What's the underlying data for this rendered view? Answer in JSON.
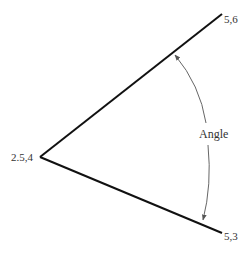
{
  "diagram": {
    "type": "angle-diagram",
    "vertex": {
      "label": "2.5,4"
    },
    "upper_point": {
      "label": "5,6"
    },
    "lower_point": {
      "label": "5,3"
    },
    "angle_label": "Angle",
    "colors": {
      "line": "#111111",
      "arc": "#666666",
      "text": "#333333"
    }
  }
}
